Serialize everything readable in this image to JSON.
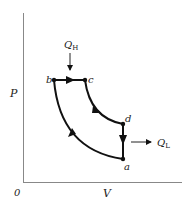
{
  "diagram": {
    "type": "PV diagram (thermodynamic cycle)",
    "axes": {
      "x_label": "V",
      "y_label": "P",
      "origin_label": "0"
    },
    "points": [
      {
        "id": "a",
        "label": "a",
        "x": 123,
        "y": 159
      },
      {
        "id": "b",
        "label": "b",
        "x": 54,
        "y": 80
      },
      {
        "id": "c",
        "label": "c",
        "x": 85,
        "y": 80
      },
      {
        "id": "d",
        "label": "d",
        "x": 123,
        "y": 124
      }
    ],
    "processes": [
      {
        "from": "a",
        "to": "b",
        "shape": "curve"
      },
      {
        "from": "b",
        "to": "c",
        "shape": "horizontal"
      },
      {
        "from": "c",
        "to": "d",
        "shape": "curve"
      },
      {
        "from": "d",
        "to": "a",
        "shape": "vertical"
      }
    ],
    "heat_in": {
      "label": "Q",
      "subscript": "H"
    },
    "heat_out": {
      "label": "Q",
      "subscript": "L"
    },
    "colors": {
      "line": "#111111",
      "text": "#222222",
      "axis": "#777777"
    }
  }
}
